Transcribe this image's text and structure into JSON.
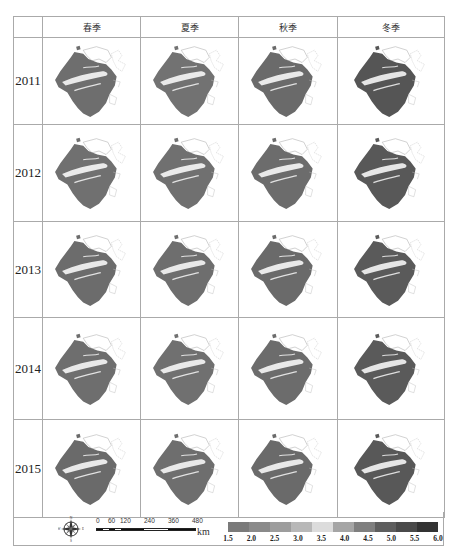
{
  "columns": [
    "春季",
    "夏季",
    "秋季",
    "冬季"
  ],
  "rows": [
    {
      "year": "2011",
      "shades": [
        "#6e6e6e",
        "#727272",
        "#6a6a6a",
        "#555555"
      ]
    },
    {
      "year": "2012",
      "shades": [
        "#707070",
        "#707070",
        "#6c6c6c",
        "#585858"
      ]
    },
    {
      "year": "2013",
      "shades": [
        "#6c6c6c",
        "#6e6e6e",
        "#6a6a6a",
        "#5a5a5a"
      ]
    },
    {
      "year": "2014",
      "shades": [
        "#6e6e6e",
        "#707070",
        "#6c6c6c",
        "#5a5a5a"
      ]
    },
    {
      "year": "2015",
      "shades": [
        "#6a6a6a",
        "#6e6e6e",
        "#6a6a6a",
        "#585858"
      ]
    }
  ],
  "legend": {
    "compass": {
      "n": "N",
      "s": "S",
      "e": "E",
      "w": "W"
    },
    "scale": {
      "ticks": [
        "0",
        "60",
        "120",
        "240",
        "360",
        "480"
      ],
      "unit": "km"
    },
    "colorbar": {
      "ticks": [
        "1.5",
        "2.0",
        "2.5",
        "3.0",
        "3.5",
        "4.0",
        "4.5",
        "5.0",
        "5.5",
        "6.0"
      ],
      "colors": [
        "#7a7a7a",
        "#8a8a8a",
        "#9d9d9d",
        "#b8b8b8",
        "#dcdcdc",
        "#a5a5a5",
        "#7f7f7f",
        "#5e5e5e",
        "#4a4a4a",
        "#333333"
      ]
    }
  },
  "chart_data": {
    "type": "heatmap",
    "title": "",
    "categories": [
      "春季",
      "夏季",
      "秋季",
      "冬季"
    ],
    "row_labels": [
      "2011",
      "2012",
      "2013",
      "2014",
      "2015"
    ],
    "colorbar": {
      "min": 1.5,
      "max": 6.0,
      "step": 0.5,
      "ticks": [
        1.5,
        2.0,
        2.5,
        3.0,
        3.5,
        4.0,
        4.5,
        5.0,
        5.5,
        6.0
      ]
    },
    "scale_bar_km": [
      0,
      60,
      120,
      240,
      360,
      480
    ],
    "grid": true,
    "legend_position": "bottom"
  }
}
